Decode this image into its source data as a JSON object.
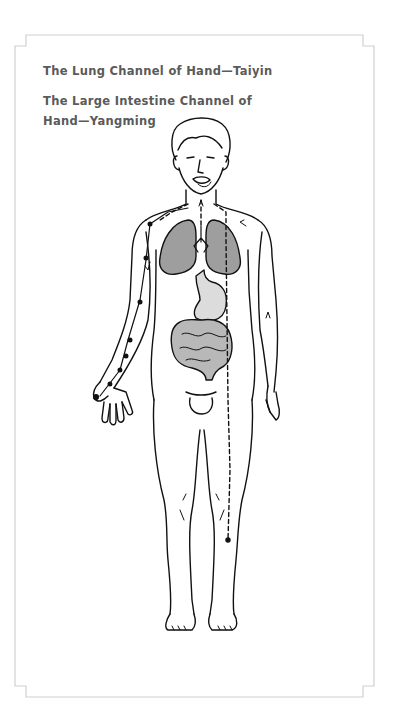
{
  "diagram": {
    "captions": [
      "The Lung Channel of Hand—Taiyin",
      "The Large Intestine Channel of Hand—Yangming"
    ],
    "figure": "human-body-front-view",
    "organs": [
      {
        "name": "lungs",
        "fill": "#9e9e9e"
      },
      {
        "name": "stomach",
        "fill": "#dcdcdc"
      },
      {
        "name": "intestines",
        "fill": "#b8b8b8"
      }
    ],
    "channels": [
      {
        "name": "lung-channel",
        "style": "solid-with-points",
        "side": "right-arm-of-figure"
      },
      {
        "name": "large-intestine-channel",
        "style": "dashed",
        "side": "trunk-and-leg"
      }
    ],
    "colors": {
      "frame": "#d0d0d0",
      "caption": "#5a5a5a",
      "outline": "#111111"
    }
  }
}
